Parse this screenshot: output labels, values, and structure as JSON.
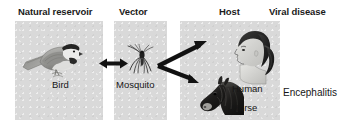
{
  "figure": {
    "headers": [
      {
        "id": "reservoir",
        "label": "Natural reservoir"
      },
      {
        "id": "vector",
        "label": "Vector"
      },
      {
        "id": "host",
        "label": "Host"
      },
      {
        "id": "disease",
        "label": "Viral disease"
      }
    ],
    "panels": [
      {
        "id": "reservoir",
        "caption": "Bird",
        "image": "chickadee-bird-photo"
      },
      {
        "id": "vector",
        "caption": "Mosquito",
        "image": "mosquito-photo"
      },
      {
        "id": "host",
        "captions": [
          "Human",
          "Horse"
        ],
        "images": [
          "woman-head-profile-photo",
          "horse-head-photo"
        ]
      }
    ],
    "captions": {
      "bird": "Bird",
      "mosquito": "Mosquito",
      "human": "Human",
      "horse": "Horse",
      "disease": "Encephalitis"
    },
    "arrows": [
      {
        "id": "bird-mosquito",
        "style": "double-headed",
        "from": "Bird",
        "to": "Mosquito"
      },
      {
        "id": "mosquito-human",
        "style": "single-headed",
        "from": "Mosquito",
        "to": "Human"
      },
      {
        "id": "mosquito-horse",
        "style": "single-headed",
        "from": "Mosquito",
        "to": "Horse"
      }
    ],
    "colors": {
      "background": "#ffffff",
      "panel": "#d9d9d9",
      "text": "#161616",
      "arrow": "#111111"
    }
  }
}
